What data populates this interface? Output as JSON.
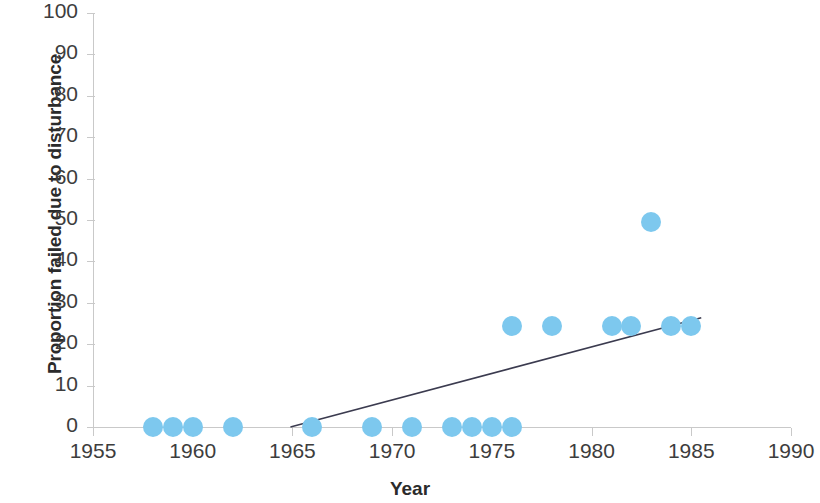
{
  "chart_data": {
    "type": "scatter",
    "title": "",
    "xlabel": "Year",
    "ylabel": "Proportion failed due to disturbance",
    "xlim": [
      1955,
      1990
    ],
    "ylim": [
      0,
      100
    ],
    "xticks": [
      1955,
      1960,
      1965,
      1970,
      1975,
      1980,
      1985,
      1990
    ],
    "yticks": [
      0,
      10,
      20,
      30,
      40,
      50,
      60,
      70,
      80,
      90,
      100
    ],
    "grid": false,
    "legend": null,
    "marker_color": "#7dc8ee",
    "trendline_color": "#3b3b4f",
    "series": [
      {
        "name": "Proportion failed due to disturbance",
        "points": [
          {
            "x": 1958,
            "y": 0
          },
          {
            "x": 1959,
            "y": 0
          },
          {
            "x": 1960,
            "y": 0
          },
          {
            "x": 1962,
            "y": 0
          },
          {
            "x": 1966,
            "y": 0
          },
          {
            "x": 1969,
            "y": 0
          },
          {
            "x": 1971,
            "y": 0
          },
          {
            "x": 1973,
            "y": 0
          },
          {
            "x": 1974,
            "y": 0
          },
          {
            "x": 1975,
            "y": 0
          },
          {
            "x": 1976,
            "y": 0
          },
          {
            "x": 1976,
            "y": 24.5
          },
          {
            "x": 1978,
            "y": 24.5
          },
          {
            "x": 1981,
            "y": 24.5
          },
          {
            "x": 1982,
            "y": 24.5
          },
          {
            "x": 1983,
            "y": 49.4
          },
          {
            "x": 1984,
            "y": 24.5
          },
          {
            "x": 1985,
            "y": 24.5
          }
        ]
      }
    ],
    "trendline": {
      "x_start": 1964.9,
      "y_start": 0,
      "x_end": 1985.5,
      "y_end": 26.4
    }
  },
  "axis": {
    "y_tick_labels": [
      "100",
      "90",
      "80",
      "70",
      "60",
      "50",
      "40",
      "30",
      "20",
      "10",
      "0"
    ],
    "x_tick_labels": [
      "1955",
      "1960",
      "1965",
      "1970",
      "1975",
      "1980",
      "1985",
      "1990"
    ],
    "y_title": "Proportion failed due to disturbance",
    "x_title": "Year"
  }
}
